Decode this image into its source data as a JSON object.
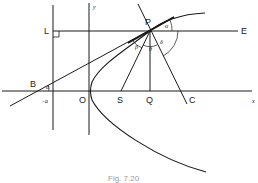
{
  "figure": {
    "caption": "Fig. 7.20",
    "points": {
      "P": "P",
      "L": "L",
      "E": "E",
      "B": "B",
      "O": "O",
      "S": "S",
      "Q": "Q",
      "C": "C"
    },
    "axes": {
      "x_label": "x",
      "y_label": "y",
      "neg_a_label": "−a"
    },
    "angles": {
      "alpha_top": "α",
      "alpha_bottom": "α",
      "beta": "β",
      "theta": "θ",
      "delta": "δ"
    },
    "colors": {
      "line": "#1a1a1a",
      "background": "#ffffff",
      "caption": "#9a9a9a"
    }
  }
}
